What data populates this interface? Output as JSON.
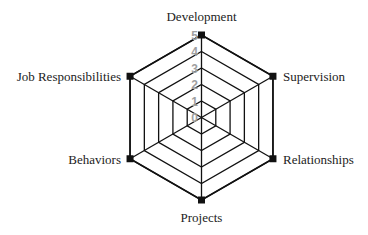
{
  "chart_data": {
    "type": "radar",
    "title": "",
    "categories": [
      "Development",
      "Supervision",
      "Relationships",
      "Projects",
      "Behaviors",
      "Job Responsibilities"
    ],
    "series": [
      {
        "name": "Rating",
        "values": [
          5,
          5,
          5,
          5,
          5,
          5
        ]
      }
    ],
    "radial_ticks": [
      "0",
      "1",
      "2",
      "3",
      "4",
      "5"
    ],
    "rmin": 0,
    "rmax": 5,
    "grid": true,
    "grid_shape": "hexagon",
    "legend": "none",
    "marker": "square",
    "colors": {
      "line": "#111111",
      "grid": "#111111",
      "marker": "#111111",
      "tick_label": "#a0a0a0",
      "axis_label": "#222222"
    }
  }
}
